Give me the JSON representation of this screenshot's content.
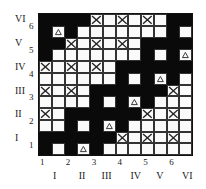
{
  "grid": {
    "rows": [
      [
        "B",
        "B",
        "B",
        "B",
        "X",
        "W",
        "X",
        "W",
        "X",
        "W",
        "B",
        "B"
      ],
      [
        "B",
        "T",
        "B",
        "W",
        "W",
        "W",
        "W",
        "W",
        "W",
        "W",
        "B",
        "W"
      ],
      [
        "B",
        "B",
        "X",
        "W",
        "X",
        "W",
        "X",
        "W",
        "B",
        "B",
        "B",
        "B"
      ],
      [
        "B",
        "W",
        "W",
        "W",
        "W",
        "W",
        "W",
        "W",
        "B",
        "W",
        "B",
        "T"
      ],
      [
        "X",
        "W",
        "X",
        "W",
        "X",
        "W",
        "B",
        "B",
        "B",
        "B",
        "B",
        "B"
      ],
      [
        "W",
        "W",
        "W",
        "W",
        "W",
        "W",
        "B",
        "W",
        "B",
        "T",
        "B",
        "W"
      ],
      [
        "X",
        "W",
        "X",
        "W",
        "B",
        "B",
        "B",
        "B",
        "B",
        "B",
        "X",
        "W"
      ],
      [
        "W",
        "W",
        "W",
        "W",
        "B",
        "W",
        "B",
        "T",
        "B",
        "W",
        "W",
        "W"
      ],
      [
        "X",
        "W",
        "B",
        "B",
        "B",
        "B",
        "B",
        "B",
        "X",
        "W",
        "X",
        "W"
      ],
      [
        "W",
        "W",
        "B",
        "W",
        "B",
        "T",
        "B",
        "W",
        "W",
        "W",
        "W",
        "W"
      ],
      [
        "B",
        "B",
        "B",
        "B",
        "B",
        "B",
        "X",
        "W",
        "X",
        "W",
        "X",
        "W"
      ],
      [
        "B",
        "W",
        "B",
        "T",
        "B",
        "W",
        "W",
        "W",
        "W",
        "W",
        "W",
        "W"
      ]
    ],
    "legend": {
      "B": "black-cell",
      "W": "white-cell",
      "X": "cross-cell",
      "T": "triangle-cell"
    }
  },
  "left_roman": [
    "VI",
    "V",
    "IV",
    "III",
    "II",
    "I"
  ],
  "left_arabic": [
    "6",
    "5",
    "4",
    "3",
    "2",
    "1"
  ],
  "bottom_arabic": [
    "1",
    "2",
    "3",
    "4",
    "5",
    "6"
  ],
  "bottom_roman": [
    "I",
    "II",
    "III",
    "IV",
    "V",
    "VI"
  ]
}
